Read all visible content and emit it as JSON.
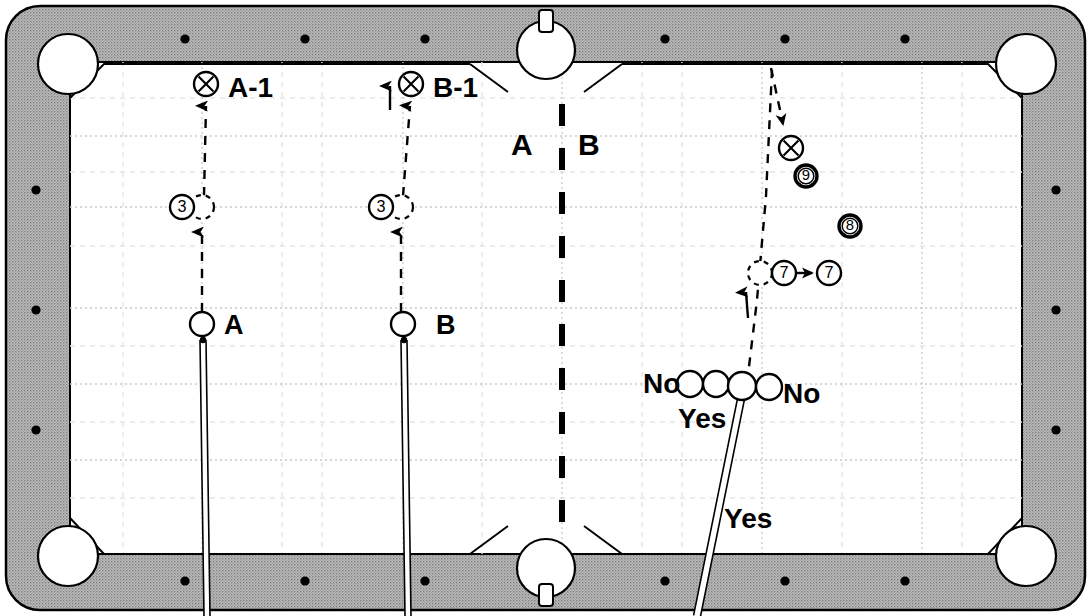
{
  "diagram": {
    "type": "billiards-instructional-diagram",
    "colors": {
      "rail": "#b3b3b3",
      "rail_stipple": "#8c8c8c",
      "cloth": "#ffffff",
      "ink": "#000000",
      "grid_major": "#c8c8c8",
      "grid_minor": "#e2e2e2",
      "pocket": "#ffffff"
    },
    "table": {
      "outer": {
        "x": 6,
        "y": 6,
        "w": 1079,
        "h": 604,
        "corner_radius": 34
      },
      "cloth": {
        "x": 70,
        "y": 62,
        "w": 952,
        "h": 492
      },
      "rail_width": 30
    }
  },
  "labels": {
    "a_shot": "A-1",
    "b_shot": "B-1",
    "zone_a": "A",
    "zone_b": "B",
    "cue_a": "A",
    "cue_b": "B",
    "no_left": "No",
    "no_right": "No",
    "yes_upper": "Yes",
    "yes_lower": "Yes"
  },
  "balls": [
    {
      "id": "x-a1",
      "label": "x",
      "kind": "x-ball",
      "cx": 206,
      "cy": 84,
      "r": 12
    },
    {
      "id": "x-b1",
      "label": "x",
      "kind": "x-ball",
      "cx": 411,
      "cy": 84,
      "r": 12
    },
    {
      "id": "three-a",
      "label": "3",
      "kind": "numbered",
      "cx": 182,
      "cy": 207,
      "r": 12
    },
    {
      "id": "three-b",
      "label": "3",
      "kind": "numbered",
      "cx": 381,
      "cy": 207,
      "r": 12
    },
    {
      "id": "x-right",
      "label": "x",
      "kind": "x-ball",
      "cx": 791,
      "cy": 148,
      "r": 12
    },
    {
      "id": "nine",
      "label": "9",
      "kind": "solid",
      "cx": 806,
      "cy": 176,
      "r": 11
    },
    {
      "id": "eight",
      "label": "8",
      "kind": "solid",
      "cx": 850,
      "cy": 226,
      "r": 11
    },
    {
      "id": "seven-1",
      "label": "7",
      "kind": "numbered",
      "cx": 784,
      "cy": 273,
      "r": 12
    },
    {
      "id": "seven-2",
      "label": "7",
      "kind": "numbered",
      "cx": 829,
      "cy": 273,
      "r": 12
    }
  ],
  "cue_balls": [
    {
      "id": "cue-a",
      "cx": 202,
      "cy": 324,
      "r": 12
    },
    {
      "id": "cue-b",
      "cx": 403,
      "cy": 324,
      "r": 12
    }
  ],
  "ghost_balls": [
    {
      "id": "ghost-a",
      "cx": 202,
      "cy": 207,
      "r": 12
    },
    {
      "id": "ghost-b",
      "cx": 401,
      "cy": 207,
      "r": 12
    },
    {
      "id": "ghost-7",
      "cx": 760,
      "cy": 273,
      "r": 12
    }
  ],
  "row_balls": [
    {
      "id": "row-1",
      "cx": 690,
      "cy": 384,
      "r": 13
    },
    {
      "id": "row-2",
      "cx": 716,
      "cy": 384,
      "r": 13
    },
    {
      "id": "row-3",
      "cx": 742,
      "cy": 386,
      "r": 14
    },
    {
      "id": "row-4",
      "cx": 769,
      "cy": 387,
      "r": 13
    }
  ],
  "cue_sticks": [
    {
      "id": "stick-a",
      "x1": 203,
      "y1": 340,
      "x2": 207,
      "y2": 616,
      "width": 6
    },
    {
      "id": "stick-b",
      "x1": 404,
      "y1": 340,
      "x2": 408,
      "y2": 616,
      "width": 6
    },
    {
      "id": "stick-right",
      "x1": 742,
      "y1": 394,
      "x2": 697,
      "y2": 616,
      "width": 7
    }
  ],
  "divider": {
    "x": 562,
    "y_start": 104,
    "y_end": 538,
    "dash": "22 22",
    "width": 6
  },
  "pockets": [
    {
      "id": "pocket-top-left",
      "cx": 68,
      "cy": 64,
      "r": 30
    },
    {
      "id": "pocket-top-middle",
      "cx": 546,
      "cy": 50,
      "r": 29
    },
    {
      "id": "pocket-top-right",
      "cx": 1026,
      "cy": 64,
      "r": 30
    },
    {
      "id": "pocket-bottom-left",
      "cx": 68,
      "cy": 556,
      "r": 30
    },
    {
      "id": "pocket-bottom-middle",
      "cx": 546,
      "cy": 568,
      "r": 29
    },
    {
      "id": "pocket-bottom-right",
      "cx": 1026,
      "cy": 556,
      "r": 30
    }
  ],
  "diamonds": {
    "top": [
      {
        "x": 185,
        "y": 39
      },
      {
        "x": 305,
        "y": 39
      },
      {
        "x": 425,
        "y": 39
      },
      {
        "x": 665,
        "y": 39
      },
      {
        "x": 785,
        "y": 39
      },
      {
        "x": 905,
        "y": 39
      }
    ],
    "bottom": [
      {
        "x": 185,
        "y": 581
      },
      {
        "x": 305,
        "y": 581
      },
      {
        "x": 425,
        "y": 581
      },
      {
        "x": 665,
        "y": 581
      },
      {
        "x": 785,
        "y": 581
      },
      {
        "x": 905,
        "y": 581
      }
    ],
    "left": [
      {
        "x": 36,
        "y": 190
      },
      {
        "x": 36,
        "y": 310
      },
      {
        "x": 36,
        "y": 430
      }
    ],
    "right": [
      {
        "x": 1056,
        "y": 190
      },
      {
        "x": 1056,
        "y": 310
      },
      {
        "x": 1056,
        "y": 430
      }
    ]
  },
  "trajectories": [
    {
      "id": "path-a-lower",
      "points": "202,312 202,232",
      "arrow_at": "202,228",
      "dash": "9 8"
    },
    {
      "id": "path-a-upper",
      "points": "204,196 206,106",
      "arrow_at": "206,102",
      "dash": "9 8"
    },
    {
      "id": "path-b-lower",
      "points": "401,312 401,232",
      "arrow_at": "401,228",
      "dash": "9 8"
    },
    {
      "id": "path-b-upper",
      "points": "403,196 410,106",
      "arrow_at": "410,102",
      "dash": "9 8"
    },
    {
      "id": "path-b-rail",
      "points": "390,110 390,86",
      "arrow_at": "390,82",
      "dash": "none"
    },
    {
      "id": "path-right-down",
      "points": "771,68 783,124",
      "arrow_at": "786,130",
      "dash": "9 8"
    },
    {
      "id": "path-right-main",
      "points": "745,400 757,300 766,196 772,70",
      "arrow_at": "none",
      "dash": "9 8"
    },
    {
      "id": "path-right-arrow-up",
      "points": "748,318 746,292",
      "arrow_at": "746,288",
      "dash": "none"
    },
    {
      "id": "path-seven",
      "points": "797,273 812,273",
      "arrow_at": "818,273",
      "dash": "none"
    }
  ],
  "grid": {
    "vertical_major": [
      202,
      403,
      562,
      762,
      922
    ],
    "vertical_minor": [
      123,
      282,
      322,
      482,
      642,
      682,
      842,
      962
    ],
    "horizontal_major": [
      136,
      207,
      308,
      384,
      460
    ],
    "horizontal_minor": [
      98,
      172,
      246,
      346,
      422,
      498
    ]
  }
}
